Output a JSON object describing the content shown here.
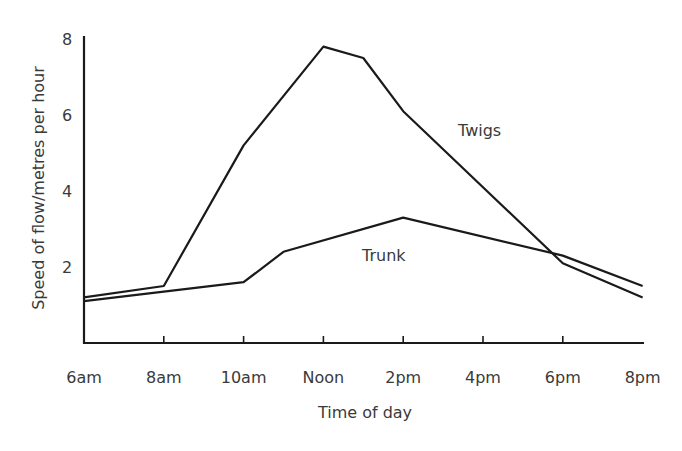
{
  "chart_data": {
    "type": "line",
    "title": "",
    "xlabel": "Time of day",
    "ylabel": "Speed of flow/metres per hour",
    "x_ticks": [
      "6am",
      "8am",
      "10am",
      "Noon",
      "2pm",
      "4pm",
      "6pm",
      "8pm"
    ],
    "y_ticks": [
      "2",
      "4",
      "6",
      "8"
    ],
    "ylim": [
      0,
      8
    ],
    "grid": false,
    "legend": "inline labels",
    "series": [
      {
        "name": "Twigs",
        "x_hours": [
          6,
          8,
          10,
          12,
          13,
          14,
          18,
          20
        ],
        "values": [
          1.2,
          1.5,
          5.2,
          7.8,
          7.5,
          6.1,
          2.1,
          1.2
        ]
      },
      {
        "name": "Trunk",
        "x_hours": [
          6,
          10,
          11,
          14,
          18,
          20
        ],
        "values": [
          1.1,
          1.6,
          2.4,
          3.3,
          2.3,
          1.5
        ]
      }
    ]
  }
}
